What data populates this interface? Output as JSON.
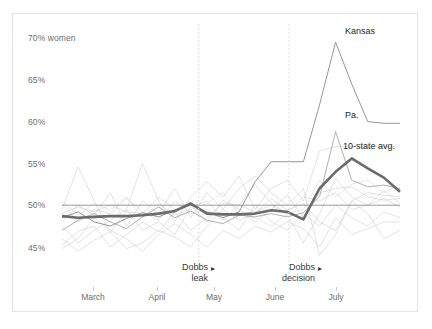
{
  "chart_data": {
    "type": "line",
    "title": "",
    "subtitle": "",
    "xlabel": "",
    "ylabel": "70% women",
    "ylim": [
      43.0,
      71.0
    ],
    "xlim": [
      0,
      21
    ],
    "grid": false,
    "legend_position": "inline-labels",
    "y_ticks": [
      {
        "value": 70,
        "label": "70% women"
      },
      {
        "value": 65,
        "label": "65%"
      },
      {
        "value": 60,
        "label": "60%"
      },
      {
        "value": 55,
        "label": "55%"
      },
      {
        "value": 50,
        "label": "50%"
      },
      {
        "value": 45,
        "label": "45%"
      }
    ],
    "x_ticks": [
      {
        "index": 2,
        "label": "March"
      },
      {
        "index": 5,
        "label": "April"
      },
      {
        "index": 8,
        "label": "May"
      },
      {
        "index": 12,
        "label": "June"
      },
      {
        "index": 15,
        "label": "July"
      }
    ],
    "reference_line": {
      "value": 50,
      "label": ""
    },
    "annotations": [
      {
        "name": "dobbs-leak",
        "line1": "Dobbs",
        "line2": "leak",
        "marker": "▸",
        "x_index": 8.5
      },
      {
        "name": "dobbs-decision",
        "line1": "Dobbs",
        "line2": "decision",
        "marker": "▸",
        "x_index": 14.1
      }
    ],
    "series_labels": [
      {
        "name": "Kansas",
        "text": "Kansas"
      },
      {
        "name": "Pennsylvania",
        "text": "Pa."
      },
      {
        "name": "10-state-average",
        "text": "10-state avg."
      }
    ],
    "x": [
      0,
      1,
      2,
      3,
      4,
      5,
      6,
      7,
      8,
      9,
      10,
      11,
      12,
      13,
      14,
      15,
      16,
      17,
      18,
      19,
      20,
      21
    ],
    "series": [
      {
        "name": "10-state avg.",
        "emphasis": "strong",
        "color": "#6b6b6b",
        "values": [
          48.7,
          48.5,
          48.6,
          48.7,
          48.7,
          48.8,
          49.0,
          49.3,
          50.2,
          49.0,
          48.9,
          48.9,
          49.0,
          49.4,
          49.2,
          48.3,
          52.0,
          54.0,
          55.6,
          54.4,
          53.3,
          51.6
        ]
      },
      {
        "name": "Kansas",
        "emphasis": "medium",
        "color": "#8a8a8a",
        "values": [
          48.5,
          49.2,
          48.0,
          47.5,
          48.4,
          49.1,
          48.6,
          49.4,
          50.0,
          49.2,
          48.5,
          49.2,
          52.8,
          55.2,
          55.2,
          55.2,
          62.0,
          69.5,
          64.5,
          60.0,
          59.8,
          59.8
        ]
      },
      {
        "name": "Pa.",
        "emphasis": "medium",
        "color": "#a8a8a8",
        "values": [
          47.0,
          48.2,
          49.0,
          48.0,
          47.2,
          48.6,
          49.8,
          48.5,
          49.3,
          48.2,
          47.8,
          48.8,
          48.6,
          49.0,
          48.6,
          49.1,
          51.0,
          58.8,
          53.0,
          52.2,
          52.4,
          52.0
        ]
      },
      {
        "name": "state-3",
        "emphasis": "faint",
        "color": "#cfcfcf",
        "values": [
          49.5,
          54.6,
          50.5,
          46.7,
          49.4,
          55.0,
          50.5,
          48.0,
          51.0,
          52.8,
          51.0,
          53.5,
          49.5,
          52.0,
          53.0,
          50.5,
          56.5,
          57.0,
          57.0,
          57.0,
          57.0,
          57.0
        ]
      },
      {
        "name": "state-4",
        "emphasis": "faint",
        "color": "#cfcfcf",
        "values": [
          46.0,
          44.5,
          45.8,
          46.8,
          44.8,
          45.5,
          47.0,
          46.2,
          45.0,
          47.5,
          49.5,
          48.2,
          49.0,
          50.8,
          49.4,
          50.2,
          48.0,
          47.0,
          50.5,
          51.5,
          51.2,
          51.0
        ]
      },
      {
        "name": "state-5",
        "emphasis": "faint",
        "color": "#cfcfcf",
        "values": [
          45.2,
          46.9,
          47.5,
          45.0,
          46.5,
          48.0,
          46.8,
          49.2,
          47.0,
          48.5,
          50.2,
          50.0,
          52.5,
          50.2,
          49.0,
          51.0,
          50.5,
          51.5,
          49.5,
          50.0,
          50.8,
          49.8
        ]
      },
      {
        "name": "state-6",
        "emphasis": "faint",
        "color": "#cfcfcf",
        "values": [
          49.0,
          49.8,
          49.2,
          50.0,
          49.2,
          49.0,
          51.0,
          49.5,
          50.0,
          48.0,
          50.6,
          49.5,
          48.0,
          49.5,
          51.2,
          48.5,
          51.5,
          52.0,
          52.2,
          51.0,
          50.6,
          50.8
        ]
      },
      {
        "name": "state-7",
        "emphasis": "faint",
        "color": "#cfcfcf",
        "values": [
          50.2,
          48.0,
          49.5,
          49.0,
          50.8,
          49.2,
          48.2,
          50.5,
          49.0,
          49.5,
          48.2,
          50.0,
          49.2,
          50.0,
          48.8,
          45.5,
          49.0,
          53.2,
          51.0,
          50.0,
          51.8,
          50.2
        ]
      },
      {
        "name": "state-8",
        "emphasis": "faint",
        "color": "#cfcfcf",
        "values": [
          44.8,
          46.0,
          48.5,
          47.0,
          46.0,
          44.5,
          46.5,
          47.8,
          46.5,
          45.0,
          47.0,
          46.0,
          47.5,
          46.8,
          48.0,
          47.2,
          45.0,
          48.5,
          46.5,
          47.2,
          48.0,
          48.0
        ]
      },
      {
        "name": "state-9",
        "emphasis": "faint",
        "color": "#cfcfcf",
        "values": [
          48.0,
          50.0,
          48.8,
          51.5,
          47.5,
          50.5,
          49.0,
          52.0,
          48.5,
          51.5,
          49.5,
          52.0,
          53.5,
          51.5,
          50.0,
          52.0,
          44.0,
          46.5,
          50.5,
          49.0,
          46.0,
          47.0
        ]
      },
      {
        "name": "state-10",
        "emphasis": "faint",
        "color": "#cfcfcf",
        "values": [
          47.5,
          45.5,
          47.0,
          48.2,
          49.5,
          47.0,
          48.0,
          46.5,
          49.8,
          50.5,
          48.5,
          47.0,
          50.0,
          48.0,
          47.0,
          49.0,
          47.5,
          50.0,
          48.5,
          47.5,
          49.2,
          48.5
        ]
      },
      {
        "name": "state-11",
        "emphasis": "faint",
        "color": "#d8d8d8",
        "values": [
          50.5,
          48.8,
          50.2,
          49.4,
          51.0,
          48.5,
          50.2,
          48.8,
          49.5,
          50.2,
          51.5,
          49.0,
          48.5,
          47.5,
          49.0,
          49.5,
          53.0,
          51.0,
          52.5,
          53.0,
          51.5,
          52.5
        ]
      }
    ]
  }
}
